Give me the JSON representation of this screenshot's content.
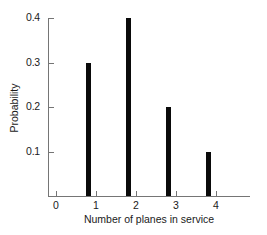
{
  "chart_data": {
    "type": "bar",
    "title": "",
    "subtitle": "",
    "xlabel": "Number of planes in service",
    "ylabel": "Probability",
    "categories": [
      "1",
      "2",
      "3",
      "4"
    ],
    "values": [
      0.3,
      0.4,
      0.2,
      0.1
    ],
    "series": [
      {
        "name": "Probability",
        "values": [
          0.3,
          0.4,
          0.2,
          0.1
        ]
      }
    ],
    "x": [
      1,
      2,
      3,
      4
    ],
    "xlim": [
      0,
      5
    ],
    "ylim": [
      0,
      0.4
    ],
    "x_ticks": [
      {
        "value": 0,
        "label": "0"
      },
      {
        "value": 1,
        "label": "1"
      },
      {
        "value": 2,
        "label": "2"
      },
      {
        "value": 3,
        "label": "3"
      },
      {
        "value": 4,
        "label": "4"
      }
    ],
    "y_ticks": [
      {
        "value": 0.1,
        "label": "0.1"
      },
      {
        "value": 0.2,
        "label": "0.2"
      },
      {
        "value": 0.3,
        "label": "0.3"
      },
      {
        "value": 0.4,
        "label": "0.4"
      }
    ],
    "grid": false,
    "legend": "none",
    "annotations": [],
    "colors": {
      "bar": "#0a0a0a",
      "axis": "#757575",
      "text": "#1a1a1a",
      "background": "#ffffff"
    }
  }
}
